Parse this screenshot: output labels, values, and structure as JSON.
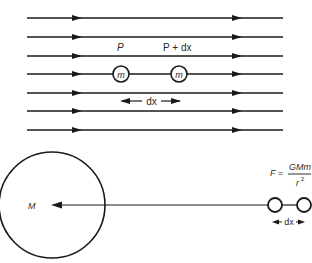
{
  "figure": {
    "top_panel": {
      "description": "uniform gravitational field lines",
      "field_line_count": 7,
      "labels": {
        "point_1": "P",
        "point_2": "P + dx",
        "mass_1": "m",
        "mass_2": "m",
        "separation": "dx"
      }
    },
    "bottom_panel": {
      "description": "non-uniform field near large mass",
      "labels": {
        "big_mass": "M",
        "force_lhs": "F =",
        "force_numerator": "GMm",
        "force_denominator": "r",
        "force_exponent": "2",
        "separation": "dx"
      }
    },
    "colors": {
      "line": "#1a1a1a",
      "background": "#ffffff"
    }
  }
}
